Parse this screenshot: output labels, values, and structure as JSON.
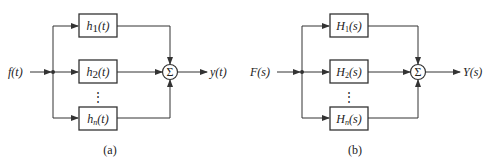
{
  "diagrams": [
    {
      "id": "a",
      "caption": "(a)",
      "input": {
        "label": "f(t)"
      },
      "output": {
        "label": "y(t)"
      },
      "blocks": [
        {
          "base": "h",
          "sub": "1",
          "arg": "(t)"
        },
        {
          "base": "h",
          "sub": "2",
          "arg": "(t)"
        },
        {
          "base": "h",
          "sub": "n",
          "arg": "(t)"
        }
      ],
      "ellipsis": "⋮",
      "summer": {
        "symbol": "Σ"
      }
    },
    {
      "id": "b",
      "caption": "(b)",
      "input": {
        "label": "F(s)"
      },
      "output": {
        "label": "Y(s)"
      },
      "blocks": [
        {
          "base": "H",
          "sub": "1",
          "arg": "(s)"
        },
        {
          "base": "H",
          "sub": "2",
          "arg": "(s)"
        },
        {
          "base": "H",
          "sub": "n",
          "arg": "(s)"
        }
      ],
      "ellipsis": "⋮",
      "summer": {
        "symbol": "Σ"
      }
    }
  ],
  "colors": {
    "line": "#333333",
    "text": "#222222",
    "background": "#ffffff"
  }
}
